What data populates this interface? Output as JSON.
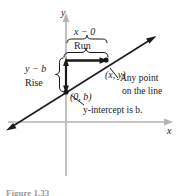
{
  "figure": {
    "type": "coordinate-plane-diagram",
    "axes": {
      "x_label": "x",
      "y_label": "y",
      "axis_color": "#b3b3b3"
    },
    "line": {
      "color": "#1a1a1a",
      "description": "straight line with arrowheads at both ends"
    },
    "labels": {
      "run_expression": "x − 0",
      "run_word": "Run",
      "rise_expression": "y − b",
      "rise_word": "Rise",
      "point_xy": "(x, y)",
      "point_0b": "(0, b)",
      "annotation_point_line1": "Any point",
      "annotation_point_line2": "on the line",
      "annotation_intercept": "y-intercept is b."
    },
    "caption": "Figure 1.33"
  }
}
